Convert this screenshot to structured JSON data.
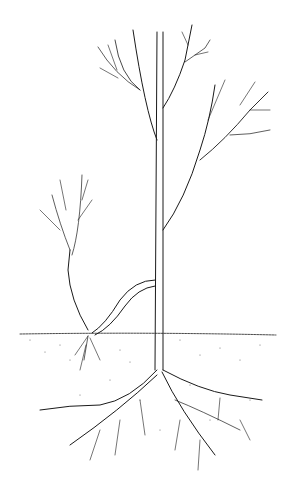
{
  "illustration": {
    "subject": "tree layering propagation line drawing",
    "colors": {
      "ink": "#1a1a1a",
      "background": "#ffffff",
      "soil_stipple": "#555555"
    },
    "elements": [
      "main-trunk",
      "upper-branches",
      "bent-layered-branch",
      "new-shoot",
      "soil-surface",
      "main-roots",
      "new-roots"
    ]
  }
}
